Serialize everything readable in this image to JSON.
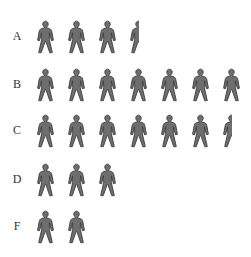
{
  "chart_data": {
    "type": "pictograph",
    "title": "",
    "icon": "person-icon",
    "icon_color": "#6e6e6e",
    "icon_outline": "#3f3f3f",
    "categories": [
      "A",
      "B",
      "C",
      "D",
      "F"
    ],
    "values": [
      3.5,
      7,
      6.5,
      3,
      2
    ],
    "xlabel": "",
    "ylabel": "",
    "grid": false,
    "legend": null
  },
  "rows": [
    {
      "label": "A",
      "value": 3.5,
      "top": 20
    },
    {
      "label": "B",
      "value": 7,
      "top": 68
    },
    {
      "label": "C",
      "value": 6.5,
      "top": 114
    },
    {
      "label": "D",
      "value": 3,
      "top": 163
    },
    {
      "label": "F",
      "value": 2,
      "top": 210
    }
  ],
  "layout": {
    "icon_spacing": 31,
    "icon_width": 19
  }
}
